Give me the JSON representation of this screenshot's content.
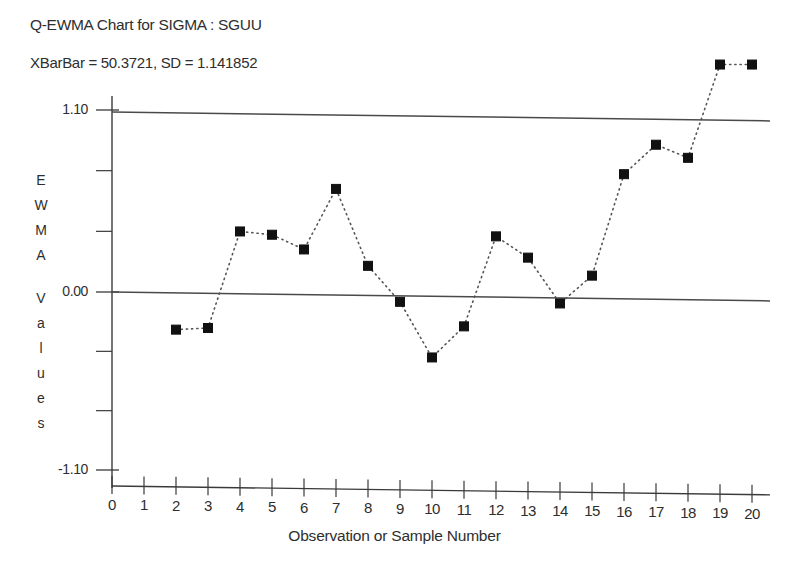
{
  "title": "Q-EWMA Chart for SIGMA : SGUU",
  "subtitle": "XBarBar = 50.3721, SD = 1.141852",
  "axis": {
    "ylabel_chars": [
      "E",
      "W",
      "M",
      "A",
      "",
      "V",
      "a",
      "l",
      "u",
      "e",
      "s"
    ],
    "ylabel_full": "EWMA Values",
    "xlabel": "Observation or Sample Number",
    "ytick_labels": [
      "1.10",
      "0.00",
      "-1.10"
    ],
    "xtick_labels": [
      "0",
      "1",
      "2",
      "3",
      "4",
      "5",
      "6",
      "7",
      "8",
      "9",
      "10",
      "11",
      "12",
      "13",
      "14",
      "15",
      "16",
      "17",
      "18",
      "19",
      "20"
    ]
  },
  "colors": {
    "axis": "#3a3a3a",
    "marker": "#111111",
    "line": "#555555",
    "limit_line": "#4a4a4a",
    "background": "#ffffff"
  },
  "chart_data": {
    "type": "line",
    "title": "Q-EWMA Chart for SIGMA : SGUU",
    "subtitle": "XBarBar = 50.3721, SD = 1.141852",
    "xlabel": "Observation or Sample Number",
    "ylabel": "EWMA Values",
    "xlim": [
      0,
      20
    ],
    "ylim": [
      -1.35,
      1.55
    ],
    "yticks": [
      1.1,
      0.0,
      -1.1
    ],
    "ytick_minor_count_between": 2,
    "xticks": [
      0,
      1,
      2,
      3,
      4,
      5,
      6,
      7,
      8,
      9,
      10,
      11,
      12,
      13,
      14,
      15,
      16,
      17,
      18,
      19,
      20
    ],
    "grid": false,
    "legend": null,
    "marker": "filled-square",
    "linestyle": "dotted",
    "reference_lines": [
      {
        "label": "1.10",
        "value": 1.1
      },
      {
        "label": "0.00",
        "value": 0.0
      }
    ],
    "x": [
      2,
      3,
      4,
      5,
      6,
      7,
      8,
      9,
      10,
      11,
      12,
      13,
      14,
      15,
      16,
      17,
      18,
      19,
      20
    ],
    "values": [
      -0.23,
      -0.22,
      0.37,
      0.35,
      0.26,
      0.63,
      0.16,
      -0.06,
      -0.4,
      -0.21,
      0.34,
      0.21,
      -0.07,
      0.1,
      0.72,
      0.9,
      0.82,
      1.39,
      1.39
    ],
    "series": [
      {
        "name": "EWMA",
        "values": [
          -0.23,
          -0.22,
          0.37,
          0.35,
          0.26,
          0.63,
          0.16,
          -0.06,
          -0.4,
          -0.21,
          0.34,
          0.21,
          -0.07,
          0.1,
          0.72,
          0.9,
          0.82,
          1.39,
          1.39
        ]
      }
    ]
  }
}
